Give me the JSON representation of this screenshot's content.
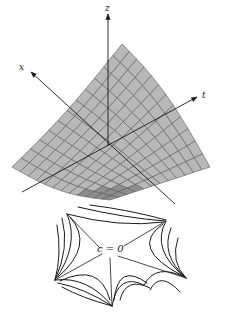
{
  "figure": {
    "surface": {
      "fill_color": "#b8b8b8",
      "shade_color": "#8e8e8e",
      "grid_color": "#5a5a5a",
      "grid_divisions": 12
    },
    "axes": {
      "x": {
        "label": "x"
      },
      "z": {
        "label": "z"
      },
      "t": {
        "label": "t"
      },
      "color": "#1a1a1a"
    },
    "contour_plot": {
      "label": "c = 0",
      "line_color": "#1a1a1a"
    }
  }
}
